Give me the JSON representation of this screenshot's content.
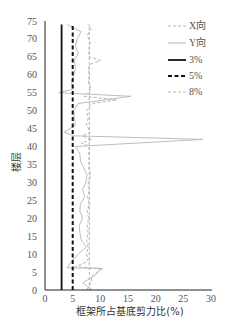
{
  "chart_data": {
    "type": "line",
    "orientation": "vertical-profile",
    "title": "",
    "xlabel": "框架所占基底剪力比(%)",
    "ylabel": "楼层",
    "xlim": [
      0,
      30
    ],
    "ylim": [
      0,
      75
    ],
    "x_ticks": [
      "0",
      "5",
      "10",
      "15",
      "20",
      "25",
      "30"
    ],
    "y_ticks": [
      "0",
      "5",
      "10",
      "15",
      "20",
      "25",
      "30",
      "35",
      "40",
      "45",
      "50",
      "55",
      "60",
      "65",
      "70",
      "75"
    ],
    "grid": false,
    "legend_position": "upper right",
    "series": [
      {
        "name": "X向",
        "style": "dashed",
        "color": "#b5b5b5",
        "points": [
          [
            7.5,
            0
          ],
          [
            8.3,
            2
          ],
          [
            8.5,
            4
          ],
          [
            10.5,
            6
          ],
          [
            5.5,
            6.5
          ],
          [
            7.8,
            8
          ],
          [
            7.5,
            10
          ],
          [
            7.8,
            12
          ],
          [
            7.5,
            14
          ],
          [
            7.8,
            16
          ],
          [
            7.6,
            18
          ],
          [
            7.9,
            20
          ],
          [
            7.6,
            22
          ],
          [
            8,
            24
          ],
          [
            7.7,
            26
          ],
          [
            8,
            28
          ],
          [
            7.8,
            30
          ],
          [
            8.3,
            32
          ],
          [
            7.9,
            34
          ],
          [
            8,
            36
          ],
          [
            7.9,
            38
          ],
          [
            8,
            40
          ],
          [
            6.5,
            41
          ],
          [
            8.5,
            42
          ],
          [
            6.8,
            43
          ],
          [
            8.2,
            44
          ],
          [
            7.5,
            46
          ],
          [
            7.8,
            48
          ],
          [
            7.5,
            50
          ],
          [
            8.5,
            52
          ],
          [
            13,
            53
          ],
          [
            7,
            54
          ],
          [
            8.4,
            56
          ],
          [
            7.8,
            58
          ],
          [
            8,
            60
          ],
          [
            7.8,
            62
          ],
          [
            8.3,
            63
          ],
          [
            10,
            64
          ],
          [
            8,
            65
          ],
          [
            7.9,
            67
          ],
          [
            8.2,
            69
          ],
          [
            7.6,
            71
          ],
          [
            8.4,
            73
          ],
          [
            7.8,
            74
          ]
        ]
      },
      {
        "name": "Y向",
        "style": "solid",
        "color": "#b5b5b5",
        "points": [
          [
            8.5,
            0
          ],
          [
            6.8,
            2
          ],
          [
            9,
            4
          ],
          [
            10,
            6
          ],
          [
            4,
            6.2
          ],
          [
            4.8,
            8
          ],
          [
            6,
            10
          ],
          [
            7.5,
            12
          ],
          [
            6.5,
            14
          ],
          [
            6.3,
            16
          ],
          [
            6.2,
            18
          ],
          [
            6.8,
            20
          ],
          [
            6.3,
            22
          ],
          [
            6.4,
            24
          ],
          [
            7.2,
            26
          ],
          [
            6.8,
            28
          ],
          [
            7.4,
            30
          ],
          [
            7.6,
            32
          ],
          [
            7,
            34
          ],
          [
            6.4,
            36
          ],
          [
            6.3,
            38
          ],
          [
            5.5,
            40
          ],
          [
            28.5,
            42
          ],
          [
            5.2,
            43
          ],
          [
            3.5,
            44
          ],
          [
            5.5,
            46
          ],
          [
            5.3,
            48
          ],
          [
            5.2,
            50
          ],
          [
            6,
            52
          ],
          [
            15.5,
            54
          ],
          [
            2.5,
            55
          ],
          [
            5,
            56
          ],
          [
            4.8,
            58
          ],
          [
            5.2,
            60
          ],
          [
            5.5,
            62
          ],
          [
            5.3,
            64
          ],
          [
            6,
            66
          ],
          [
            5.5,
            68
          ],
          [
            5.8,
            70
          ],
          [
            6.5,
            72
          ],
          [
            4,
            74
          ]
        ]
      },
      {
        "name": "3%",
        "style": "solid-thick",
        "color": "#111111",
        "points": [
          [
            3,
            0
          ],
          [
            3,
            74
          ]
        ]
      },
      {
        "name": "5%",
        "style": "dashed-thick",
        "color": "#111111",
        "points": [
          [
            5,
            0
          ],
          [
            5,
            74
          ]
        ]
      },
      {
        "name": "8%",
        "style": "dashed",
        "color": "#b5b5b5",
        "points": [
          [
            8,
            0
          ],
          [
            8,
            74
          ]
        ]
      }
    ]
  },
  "axes": {
    "xlabel": "框架所占基底剪力比(%)",
    "ylabel": "楼层"
  },
  "legend": [
    {
      "label": "X向"
    },
    {
      "label": "Y向"
    },
    {
      "label": "3%"
    },
    {
      "label": "5%"
    },
    {
      "label": "8%"
    }
  ]
}
